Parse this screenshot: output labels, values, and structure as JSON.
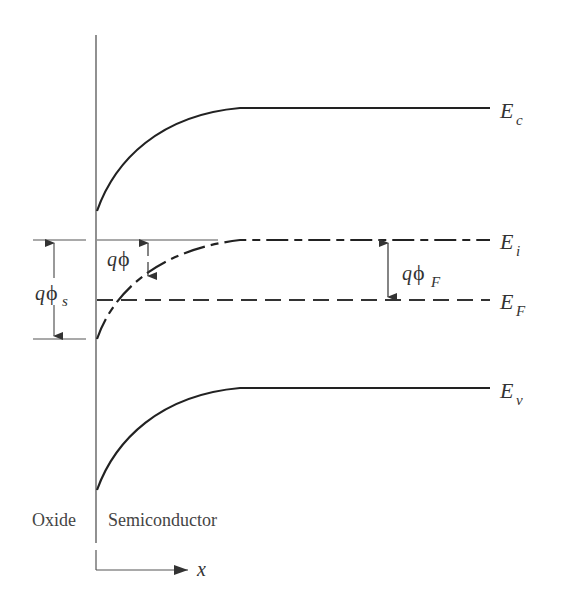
{
  "diagram": {
    "type": "band-diagram",
    "colors": {
      "line": "#222222",
      "thin_line": "#555555",
      "text": "#333333"
    },
    "bands": {
      "conduction": {
        "symbol": "E",
        "subscript": "c",
        "style": "solid"
      },
      "intrinsic": {
        "symbol": "E",
        "subscript": "i",
        "style": "dash-dot"
      },
      "fermi": {
        "symbol": "E",
        "subscript": "F",
        "style": "dashed"
      },
      "valence": {
        "symbol": "E",
        "subscript": "v",
        "style": "solid"
      }
    },
    "annotations": {
      "surface_potential": {
        "q": "q",
        "phi": "ϕ",
        "subscript": "s"
      },
      "local_potential": {
        "q": "q",
        "phi": "ϕ",
        "subscript": ""
      },
      "fermi_potential": {
        "q": "q",
        "phi": "ϕ",
        "subscript": "F"
      }
    },
    "regions": {
      "left": "Oxide",
      "right": "Semiconductor"
    },
    "axis": {
      "label": "x"
    }
  }
}
